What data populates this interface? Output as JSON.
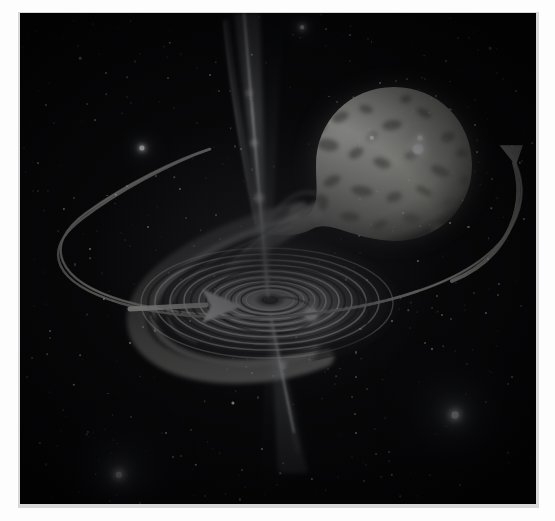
{
  "image": {
    "kind": "astronomical-illustration",
    "title": "Artist's impression of an X-ray binary: black hole accretion disk with relativistic jets and a Roche-lobe-filling companion star",
    "palette": {
      "background": "#050506",
      "sky_deep": "#0a0a0c",
      "star_white": "#ffffff",
      "disk_bright": "#f2f2ee",
      "disk_mid": "#b9b9b2",
      "disk_dark": "#1a1a1c",
      "jet_glow": "#cfd2d6",
      "companion_star": "#c9c9c2",
      "orbit_ring": "#9a9a95",
      "mat": "#fdfdfd",
      "mat_shadow": "#d8d8d8"
    },
    "border": {
      "mat_label": "white photographic mat",
      "plate_label": "printed plate"
    }
  },
  "caption": {
    "text": ""
  },
  "objects": [
    {
      "id": "companion-star",
      "label": "Companion star (Roche lobe filling, teardrop shaped)",
      "cx": 374,
      "cy": 152,
      "rx": 82,
      "ry": 74
    },
    {
      "id": "accretion-stream",
      "label": "Accretion stream flowing from companion to disk"
    },
    {
      "id": "accretion-disk",
      "label": "Accretion disk with concentric spiral rings",
      "cx": 247,
      "cy": 290,
      "rx": 128,
      "ry": 58
    },
    {
      "id": "black-hole",
      "label": "Central black hole",
      "cx": 247,
      "cy": 287
    },
    {
      "id": "hot-spot",
      "label": "Bright hot spot on the disk rim",
      "cx": 291,
      "cy": 300
    },
    {
      "id": "jet-upper",
      "label": "Upper relativistic jet"
    },
    {
      "id": "jet-lower",
      "label": "Lower relativistic jet"
    },
    {
      "id": "orbit-ring",
      "label": "Binary orbital path (ellipse)"
    },
    {
      "id": "orbit-arrow-right",
      "label": "Orbital direction arrow (right side, counter-clockwise)"
    },
    {
      "id": "inflow-arrow-disk",
      "label": "Disk inflow direction arrow"
    },
    {
      "id": "inflow-arrow-stream",
      "label": "Stream inflow direction arrow"
    }
  ],
  "stars": [
    {
      "x": 122,
      "y": 135,
      "r": 2.6,
      "glow": "glow"
    },
    {
      "x": 99,
      "y": 462,
      "r": 3.2,
      "glow": "bigglow"
    },
    {
      "x": 435,
      "y": 402,
      "r": 3.4,
      "glow": "bigglow"
    },
    {
      "x": 400,
      "y": 125,
      "r": 2.4,
      "glow": "glow"
    },
    {
      "x": 282,
      "y": 14,
      "r": 1.8,
      "glow": "glow"
    },
    {
      "x": 213,
      "y": 390,
      "r": 1.6,
      "glow": ""
    },
    {
      "x": 60,
      "y": 45,
      "r": 1.3,
      "glow": ""
    },
    {
      "x": 26,
      "y": 92,
      "r": 1.1,
      "glow": ""
    },
    {
      "x": 86,
      "y": 60,
      "r": 1.0,
      "glow": ""
    },
    {
      "x": 150,
      "y": 30,
      "r": 1.2,
      "glow": ""
    },
    {
      "x": 190,
      "y": 62,
      "r": 1.0,
      "glow": ""
    },
    {
      "x": 232,
      "y": 42,
      "r": 1.2,
      "glow": ""
    },
    {
      "x": 330,
      "y": 22,
      "r": 1.1,
      "glow": ""
    },
    {
      "x": 360,
      "y": 70,
      "r": 1.0,
      "glow": ""
    },
    {
      "x": 470,
      "y": 35,
      "r": 1.3,
      "glow": ""
    },
    {
      "x": 496,
      "y": 78,
      "r": 1.1,
      "glow": ""
    },
    {
      "x": 455,
      "y": 112,
      "r": 1.0,
      "glow": ""
    },
    {
      "x": 500,
      "y": 150,
      "r": 1.2,
      "glow": ""
    },
    {
      "x": 18,
      "y": 150,
      "r": 1.0,
      "glow": ""
    },
    {
      "x": 44,
      "y": 196,
      "r": 1.1,
      "glow": ""
    },
    {
      "x": 70,
      "y": 236,
      "r": 1.0,
      "glow": ""
    },
    {
      "x": 96,
      "y": 182,
      "r": 1.2,
      "glow": ""
    },
    {
      "x": 128,
      "y": 214,
      "r": 1.0,
      "glow": ""
    },
    {
      "x": 160,
      "y": 176,
      "r": 1.1,
      "glow": ""
    },
    {
      "x": 196,
      "y": 202,
      "r": 1.0,
      "glow": ""
    },
    {
      "x": 84,
      "y": 286,
      "r": 1.1,
      "glow": ""
    },
    {
      "x": 30,
      "y": 318,
      "r": 1.0,
      "glow": ""
    },
    {
      "x": 54,
      "y": 372,
      "r": 1.2,
      "glow": ""
    },
    {
      "x": 110,
      "y": 330,
      "r": 1.0,
      "glow": ""
    },
    {
      "x": 20,
      "y": 430,
      "r": 1.1,
      "glow": ""
    },
    {
      "x": 146,
      "y": 420,
      "r": 1.0,
      "glow": ""
    },
    {
      "x": 176,
      "y": 452,
      "r": 1.2,
      "glow": ""
    },
    {
      "x": 242,
      "y": 436,
      "r": 1.0,
      "glow": ""
    },
    {
      "x": 292,
      "y": 466,
      "r": 1.1,
      "glow": ""
    },
    {
      "x": 336,
      "y": 420,
      "r": 1.0,
      "glow": ""
    },
    {
      "x": 372,
      "y": 462,
      "r": 1.2,
      "glow": ""
    },
    {
      "x": 412,
      "y": 336,
      "r": 1.0,
      "glow": ""
    },
    {
      "x": 466,
      "y": 300,
      "r": 1.1,
      "glow": ""
    },
    {
      "x": 492,
      "y": 364,
      "r": 1.0,
      "glow": ""
    },
    {
      "x": 488,
      "y": 440,
      "r": 1.2,
      "glow": ""
    },
    {
      "x": 440,
      "y": 472,
      "r": 1.0,
      "glow": ""
    },
    {
      "x": 398,
      "y": 248,
      "r": 1.1,
      "glow": ""
    },
    {
      "x": 430,
      "y": 210,
      "r": 1.0,
      "glow": ""
    },
    {
      "x": 468,
      "y": 246,
      "r": 1.0,
      "glow": ""
    },
    {
      "x": 504,
      "y": 206,
      "r": 1.1,
      "glow": ""
    },
    {
      "x": 372,
      "y": 308,
      "r": 1.0,
      "glow": ""
    },
    {
      "x": 120,
      "y": 490,
      "r": 1.0,
      "glow": ""
    },
    {
      "x": 252,
      "y": 492,
      "r": 1.0,
      "glow": ""
    },
    {
      "x": 406,
      "y": 498,
      "r": 1.0,
      "glow": ""
    },
    {
      "x": 352,
      "y": 125,
      "r": 2.2,
      "glow": "glow"
    }
  ]
}
